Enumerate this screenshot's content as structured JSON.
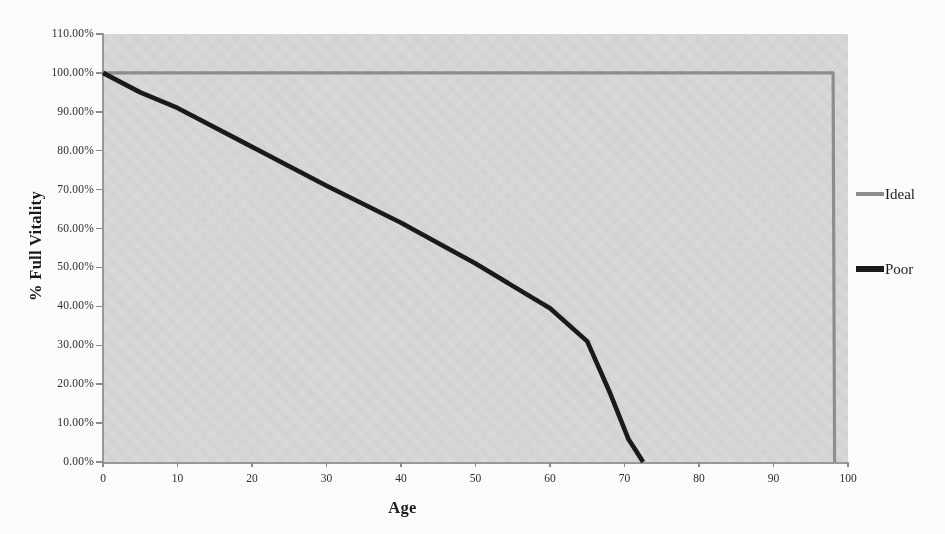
{
  "chart_data": {
    "type": "line",
    "title": "",
    "subtitle": "",
    "xlabel": "Age",
    "ylabel": "% Full Vitality",
    "xlim": [
      0,
      100
    ],
    "ylim": [
      0,
      110
    ],
    "grid": false,
    "plot_background_color": "#d6d6d6",
    "legend_position": "right",
    "x_tick_labels": [
      "0",
      "10",
      "20",
      "30",
      "40",
      "50",
      "60",
      "70",
      "80",
      "90",
      "100"
    ],
    "x_tick_values": [
      0,
      10,
      20,
      30,
      40,
      50,
      60,
      70,
      80,
      90,
      100
    ],
    "y_tick_labels": [
      "0.00%",
      "10.00%",
      "20.00%",
      "30.00%",
      "40.00%",
      "50.00%",
      "60.00%",
      "70.00%",
      "80.00%",
      "90.00%",
      "100.00%",
      "110.00%"
    ],
    "y_tick_values": [
      0,
      10,
      20,
      30,
      40,
      50,
      60,
      70,
      80,
      90,
      100,
      110
    ],
    "series": [
      {
        "name": "Ideal",
        "color": "#8f8f8f",
        "line_width": 3.2,
        "points": [
          {
            "x": 0,
            "y": 100
          },
          {
            "x": 98,
            "y": 100
          },
          {
            "x": 98.2,
            "y": 0
          }
        ]
      },
      {
        "name": "Poor",
        "color": "#1a1a1a",
        "line_width": 4.6,
        "points": [
          {
            "x": 0,
            "y": 100
          },
          {
            "x": 5,
            "y": 95
          },
          {
            "x": 10,
            "y": 91
          },
          {
            "x": 20,
            "y": 81
          },
          {
            "x": 30,
            "y": 71
          },
          {
            "x": 40,
            "y": 61.5
          },
          {
            "x": 50,
            "y": 51
          },
          {
            "x": 60,
            "y": 39.5
          },
          {
            "x": 65,
            "y": 31
          },
          {
            "x": 68,
            "y": 18
          },
          {
            "x": 70.5,
            "y": 6
          },
          {
            "x": 71.5,
            "y": 3
          },
          {
            "x": 72.5,
            "y": 0
          }
        ]
      }
    ]
  },
  "legend": {
    "entries": [
      {
        "label": "Ideal",
        "color": "#8f8f8f"
      },
      {
        "label": "Poor",
        "color": "#1a1a1a"
      }
    ]
  },
  "axes": {
    "x_title": "Age",
    "y_title": "% Full Vitality"
  }
}
